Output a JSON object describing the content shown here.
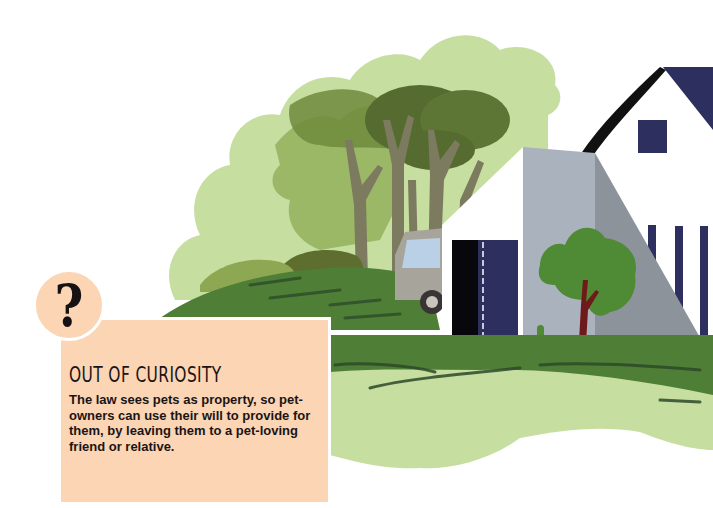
{
  "callout": {
    "icon": "question-mark-icon",
    "icon_glyph": "?",
    "title": "OUT OF CURIOSITY",
    "body": "The law sees pets as property, so pet-owners can use their will to provide for them, by leaving them to a pet-loving friend or relative."
  },
  "illustration": {
    "subject": "white house with outbuilding, trees, van and lawn",
    "colors": {
      "light_green": "#c6dea0",
      "mid_green": "#9ab866",
      "olive_green": "#6f8a3c",
      "dark_olive": "#556b2f",
      "lawn_green": "#4f7f36",
      "dark_stroke": "#2e4a2a",
      "tree_trunk": "#7d7b5f",
      "wall_grey": "#aab2bd",
      "shade_grey": "#8c939b",
      "navy": "#2d2f5e",
      "card_peach": "#fbd5b4",
      "small_tree_green": "#4f8a34",
      "small_tree_trunk": "#6e1a1a"
    }
  }
}
